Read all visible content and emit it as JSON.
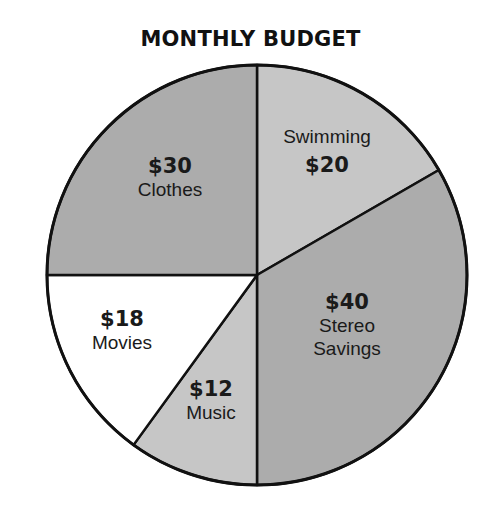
{
  "chart_data": {
    "type": "pie",
    "title": "MONTHLY BUDGET",
    "categories": [
      "Swimming",
      "Stereo Savings",
      "Music",
      "Movies",
      "Clothes"
    ],
    "values": [
      20,
      40,
      12,
      18,
      30
    ],
    "value_labels": [
      "$20",
      "$40",
      "$12",
      "$18",
      "$30"
    ],
    "total": 120,
    "unit": "$",
    "start_angle_deg": -90,
    "direction": "clockwise",
    "colors": [
      "#c6c6c6",
      "#acacac",
      "#c6c6c6",
      "#ffffff",
      "#acacac"
    ],
    "legend": "none"
  },
  "title": "MONTHLY BUDGET",
  "slices": [
    {
      "name": "Swimming",
      "amount": "$20"
    },
    {
      "name": "Stereo",
      "name2": "Savings",
      "amount": "$40"
    },
    {
      "name": "Music",
      "amount": "$12"
    },
    {
      "name": "Movies",
      "amount": "$18"
    },
    {
      "name": "Clothes",
      "amount": "$30"
    }
  ]
}
